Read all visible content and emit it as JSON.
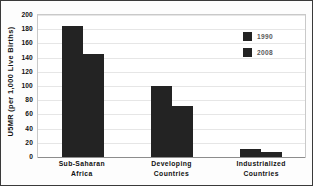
{
  "chart_data": {
    "type": "bar",
    "title": "",
    "subtitle": "",
    "xlabel": "",
    "ylabel": "U5MR (per 1,000 Live Births)",
    "categories": [
      "Sub-Saharan Africa",
      "Developing Countries",
      "Industrialized Countries"
    ],
    "category_lines": [
      [
        "Sub-Saharan",
        "Africa"
      ],
      [
        "Developing",
        "Countries"
      ],
      [
        "Industrialized",
        "Countries"
      ]
    ],
    "series": [
      {
        "name": "1990",
        "values": [
          184,
          100,
          11
        ],
        "color": "#232323"
      },
      {
        "name": "2008",
        "values": [
          145,
          72,
          7
        ],
        "color": "#232323"
      }
    ],
    "ylim": [
      0,
      200
    ],
    "ytick_step": 20,
    "ytick_labels": [
      "200",
      "180",
      "160",
      "140",
      "120",
      "100",
      "80",
      "60",
      "40",
      "20",
      "0"
    ],
    "ytick_values": [
      200,
      180,
      160,
      140,
      120,
      100,
      80,
      60,
      40,
      20,
      0
    ],
    "grid": true,
    "legend_position": "top-right",
    "annotations": []
  },
  "legend": {
    "entries": [
      {
        "label": "1990",
        "swatch_name": "legend-swatch-1990"
      },
      {
        "label": "2008",
        "swatch_name": "legend-swatch-2008"
      }
    ]
  },
  "colors": {
    "bar": "#232323",
    "grid": "#e6e6e6",
    "plot_background": "#ffffff",
    "figure_background": "#fdfdfd",
    "border": "#3a3a3a",
    "text": "#111111",
    "legend_text": "#5a5a5a"
  }
}
